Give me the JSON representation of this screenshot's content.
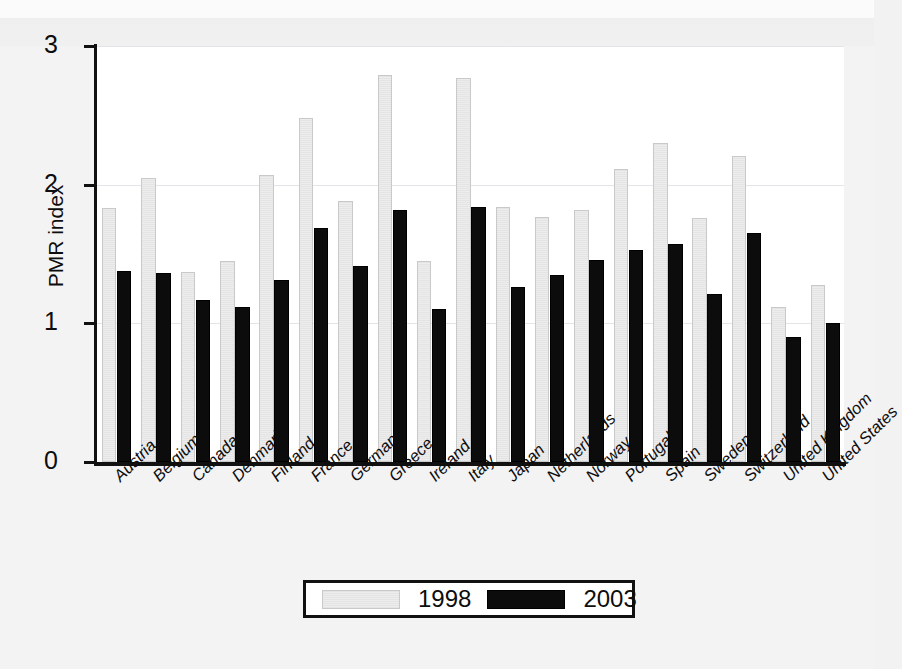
{
  "chart_data": {
    "type": "bar",
    "title": "",
    "subtitle": "",
    "xlabel": "",
    "ylabel": "PMR index",
    "ylim": [
      0,
      3
    ],
    "yticks": [
      "0",
      "1",
      "2",
      "3"
    ],
    "grid": true,
    "legend_position": "bottom",
    "categories": [
      "Austria",
      "Belgium",
      "Canada",
      "Denmark",
      "Finland",
      "France",
      "Germany",
      "Greece",
      "Ireland",
      "Italy",
      "Japan",
      "Netherlands",
      "Norway",
      "Portugal",
      "Spain",
      "Sweden",
      "Switzerland",
      "United Kingdom",
      "United States"
    ],
    "series": [
      {
        "name": "1998",
        "color": "#ededed",
        "values": [
          1.83,
          2.05,
          1.37,
          1.45,
          2.07,
          2.48,
          1.88,
          2.79,
          1.45,
          2.77,
          1.84,
          1.77,
          1.82,
          2.11,
          2.3,
          1.76,
          2.21,
          1.12,
          1.28
        ]
      },
      {
        "name": "2003",
        "color": "#0c0c0c",
        "values": [
          1.38,
          1.36,
          1.17,
          1.12,
          1.31,
          1.69,
          1.41,
          1.82,
          1.1,
          1.84,
          1.26,
          1.35,
          1.46,
          1.53,
          1.57,
          1.21,
          1.65,
          0.9,
          1.0
        ]
      }
    ]
  },
  "legend": {
    "entries": [
      {
        "label": "1998",
        "swatch": "light"
      },
      {
        "label": "2003",
        "swatch": "dark"
      }
    ]
  }
}
